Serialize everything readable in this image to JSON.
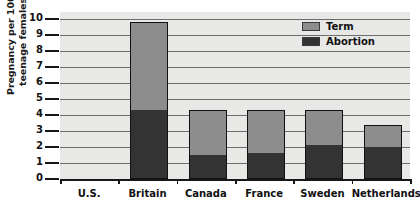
{
  "chart_data": {
    "type": "bar",
    "title": "",
    "xlabel": "",
    "ylabel": "Pregnancy per 1000 teenage females",
    "ylabel_line1": "Pregnancy per 1000",
    "ylabel_line2": "teenage females",
    "ylim": [
      0,
      10
    ],
    "ytick_labels": [
      "10",
      "9",
      "8",
      "7",
      "6",
      "5",
      "4",
      "3",
      "2",
      "1",
      "0"
    ],
    "yticks": [
      10,
      9,
      8,
      7,
      6,
      5,
      4,
      3,
      2,
      1,
      0
    ],
    "grid": true,
    "stacked": true,
    "legend_position": "top-right",
    "categories": [
      "U.S.",
      "Britain",
      "Canada",
      "France",
      "Sweden",
      "Netherlands"
    ],
    "series": [
      {
        "name": "Term",
        "color": "#8d8d8d",
        "values": [
          5.5,
          2.8,
          2.7,
          2.2,
          1.4,
          0.5
        ]
      },
      {
        "name": "Abortion",
        "color": "#333333",
        "values": [
          4.3,
          1.5,
          1.6,
          2.1,
          2.0,
          0.9
        ]
      }
    ],
    "totals": [
      9.8,
      4.3,
      4.3,
      4.3,
      3.4,
      1.4
    ]
  },
  "legend": {
    "items": [
      {
        "label": "Term",
        "color": "#8d8d8d"
      },
      {
        "label": "Abortion",
        "color": "#333333"
      }
    ]
  }
}
